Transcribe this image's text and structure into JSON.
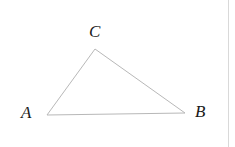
{
  "figure": {
    "kind": "geometry-diagram",
    "shape": "triangle",
    "background_color": "#ffffff",
    "stroke_color": "#b8b8b8",
    "stroke_width": 1,
    "label_color": "#1a1a1a",
    "rule_color": "#d9d9d9",
    "canvas": {
      "width": 235,
      "height": 147
    },
    "vertices": [
      {
        "name": "A",
        "label": "A",
        "x": 47,
        "y": 115,
        "label_x": 21,
        "label_y": 104
      },
      {
        "name": "B",
        "label": "B",
        "x": 185,
        "y": 113,
        "label_x": 195,
        "label_y": 103
      },
      {
        "name": "C",
        "label": "C",
        "x": 95,
        "y": 49,
        "label_x": 89,
        "label_y": 23
      }
    ],
    "edges": [
      {
        "name": "AC",
        "from": "A",
        "to": "C"
      },
      {
        "name": "CB",
        "from": "C",
        "to": "B"
      },
      {
        "name": "AB",
        "from": "A",
        "to": "B"
      }
    ],
    "divider": {
      "name": "right-rule",
      "x": 228,
      "y": 0,
      "height": 147,
      "width": 1
    }
  }
}
